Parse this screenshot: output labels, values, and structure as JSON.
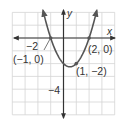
{
  "chart_data": {
    "type": "line",
    "title": "",
    "function": "y = (x + 1)(x - 2)",
    "xlabel": "x",
    "ylabel": "y",
    "xlim": [
      -4,
      4
    ],
    "ylim": [
      -6,
      2
    ],
    "grid": true,
    "grid_step": 1,
    "tick_labels": {
      "x": [
        {
          "value": -2,
          "label": "−2"
        }
      ],
      "y": [
        {
          "value": -4,
          "label": "−4"
        }
      ]
    },
    "series": [
      {
        "name": "parabola",
        "x": [
          -1.6,
          -1.5,
          -1,
          -0.5,
          0,
          0.5,
          1,
          1.5,
          2,
          2.5,
          2.6
        ],
        "y": [
          1.36,
          0.75,
          0,
          -1.25,
          -2,
          -2.25,
          -2,
          -1.25,
          0,
          1.75,
          2.16
        ]
      }
    ],
    "annotations": [
      {
        "x": -1,
        "y": 0,
        "label": "(−1, 0)"
      },
      {
        "x": 2,
        "y": 0,
        "label": "(2, 0)"
      },
      {
        "x": 1,
        "y": -2,
        "label": "(1, −2)"
      }
    ],
    "colors": {
      "curve": "#555555",
      "axes": "#333333",
      "grid": "#d4d4d4",
      "points": "#555555"
    }
  },
  "labels": {
    "x_axis": "x",
    "y_axis": "y",
    "tick_neg2": "−2",
    "tick_neg4": "−4",
    "point_a": "(−1, 0)",
    "point_b": "(2, 0)",
    "point_c": "(1, −2)"
  }
}
